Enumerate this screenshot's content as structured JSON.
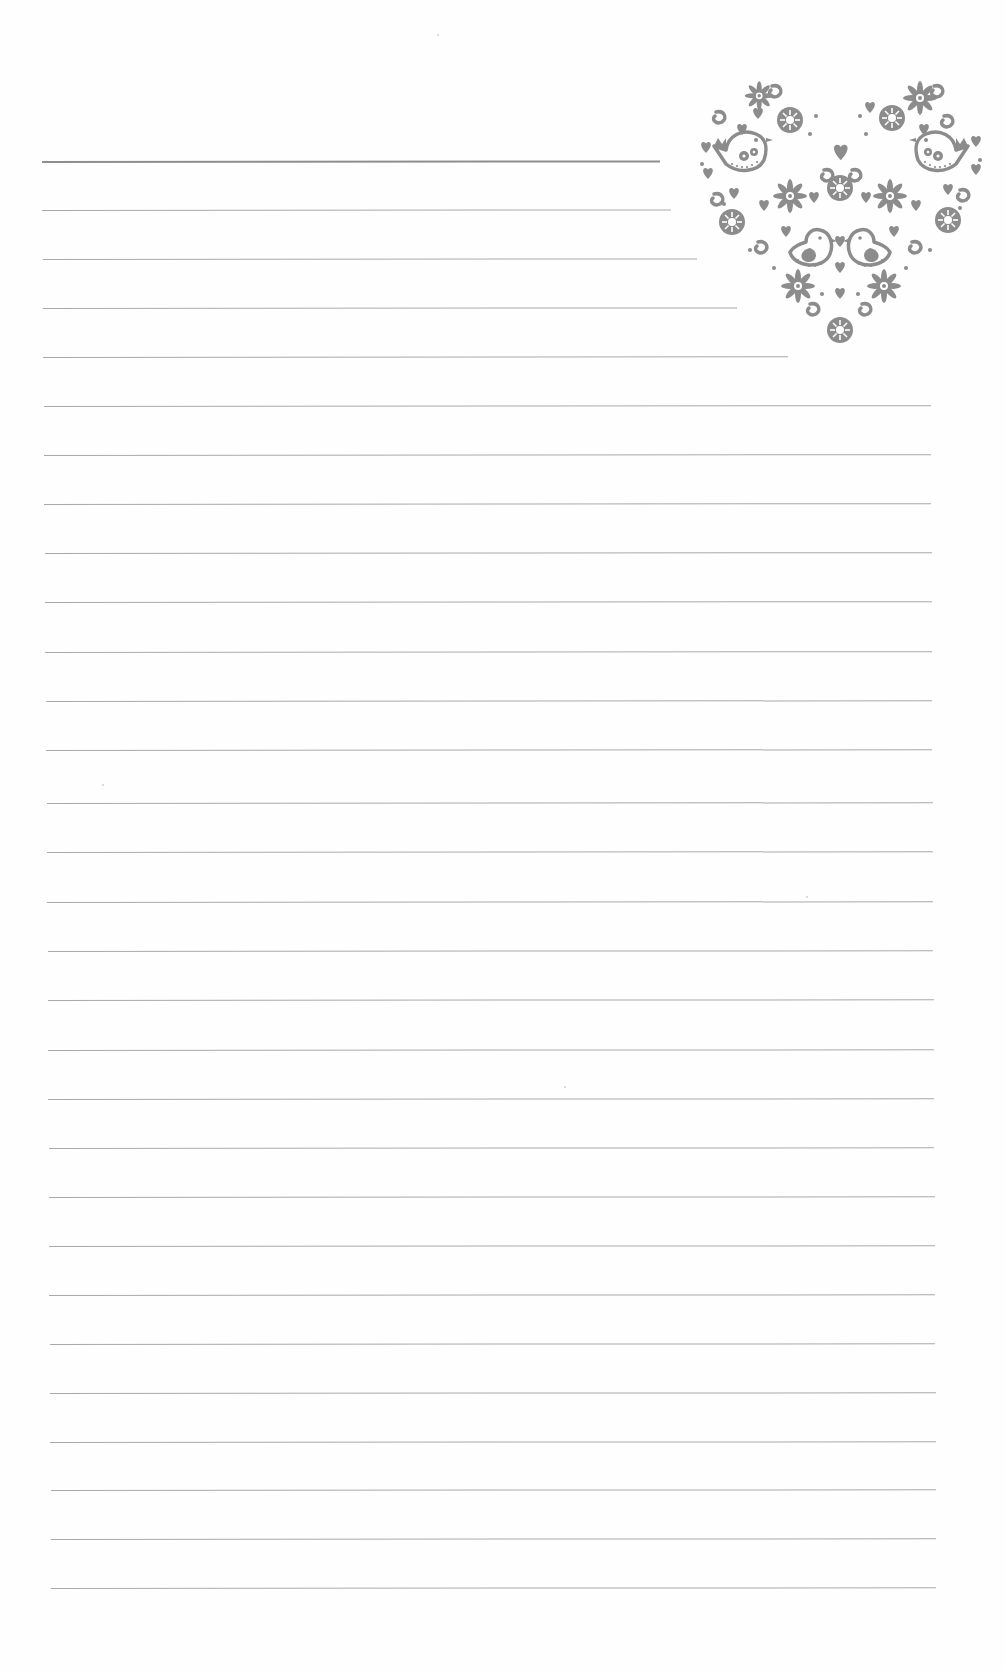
{
  "page": {
    "type": "lined writing paper",
    "background_color": "#fefefe",
    "rule_color": "#a9a9a9",
    "first_rule_color": "#8e8e8e",
    "ornament_color": "#8c8c8c"
  },
  "ornament": {
    "icon": "folk-art-heart-icon",
    "motifs": [
      "birds",
      "flowers",
      "small-hearts",
      "swirls",
      "dots"
    ]
  },
  "rules": [
    {
      "y": 161,
      "x1": 42,
      "x2": 660
    },
    {
      "y": 210,
      "x1": 42,
      "x2": 671
    },
    {
      "y": 259,
      "x1": 43,
      "x2": 697
    },
    {
      "y": 308,
      "x1": 43,
      "x2": 737
    },
    {
      "y": 357,
      "x1": 43,
      "x2": 788
    },
    {
      "y": 406,
      "x1": 44,
      "x2": 931
    },
    {
      "y": 455,
      "x1": 44,
      "x2": 931
    },
    {
      "y": 504,
      "x1": 44,
      "x2": 931
    },
    {
      "y": 553,
      "x1": 45,
      "x2": 932
    },
    {
      "y": 602,
      "x1": 45,
      "x2": 932
    },
    {
      "y": 652,
      "x1": 45,
      "x2": 932
    },
    {
      "y": 701,
      "x1": 46,
      "x2": 932
    },
    {
      "y": 750,
      "x1": 46,
      "x2": 932
    },
    {
      "y": 803,
      "x1": 47,
      "x2": 933
    },
    {
      "y": 852,
      "x1": 47,
      "x2": 933
    },
    {
      "y": 902,
      "x1": 47,
      "x2": 933
    },
    {
      "y": 951,
      "x1": 48,
      "x2": 933
    },
    {
      "y": 1000,
      "x1": 48,
      "x2": 934
    },
    {
      "y": 1050,
      "x1": 48,
      "x2": 934
    },
    {
      "y": 1099,
      "x1": 48,
      "x2": 934
    },
    {
      "y": 1148,
      "x1": 49,
      "x2": 934
    },
    {
      "y": 1197,
      "x1": 49,
      "x2": 935
    },
    {
      "y": 1246,
      "x1": 49,
      "x2": 935
    },
    {
      "y": 1295,
      "x1": 49,
      "x2": 935
    },
    {
      "y": 1344,
      "x1": 50,
      "x2": 935
    },
    {
      "y": 1393,
      "x1": 50,
      "x2": 936
    },
    {
      "y": 1442,
      "x1": 50,
      "x2": 936
    },
    {
      "y": 1490,
      "x1": 51,
      "x2": 936
    },
    {
      "y": 1539,
      "x1": 51,
      "x2": 936
    },
    {
      "y": 1588,
      "x1": 51,
      "x2": 936
    }
  ]
}
